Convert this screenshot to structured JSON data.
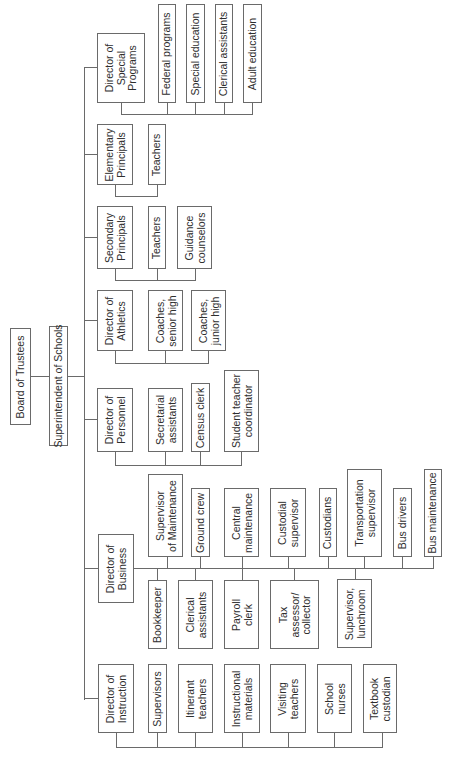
{
  "diagram": {
    "type": "organizational-chart",
    "orientation": "rotated-90-ccw",
    "root": {
      "label": "Board of Trustees",
      "rect": [
        10,
        328,
        21,
        97
      ]
    },
    "superintendent": {
      "label": "Superintendent of Schools",
      "rect": [
        49,
        326,
        19,
        120
      ]
    },
    "directors": [
      {
        "label": "Director of\nSpecial\nPrograms",
        "rect": [
          97,
          33,
          48,
          70
        ],
        "children": [
          {
            "label": "Federal programs",
            "rect": [
              158,
              4,
              18,
              99
            ]
          },
          {
            "label": "Special education",
            "rect": [
              186,
              4,
              19,
              99
            ]
          },
          {
            "label": "Clerical assistants",
            "rect": [
              215,
              4,
              18,
              99
            ]
          },
          {
            "label": "Adult education",
            "rect": [
              243,
              4,
              19,
              99
            ]
          }
        ]
      },
      {
        "label": "Elementary\nPrincipals",
        "rect": [
          97,
          124,
          36,
          61
        ],
        "children": [
          {
            "label": "Teachers",
            "rect": [
              148,
              124,
              18,
              61
            ]
          }
        ]
      },
      {
        "label": "Secondary\nPrincipals",
        "rect": [
          97,
          206,
          36,
          63
        ],
        "children": [
          {
            "label": "Teachers",
            "rect": [
              148,
              206,
              18,
              63
            ]
          },
          {
            "label": "Guidance\ncounselors",
            "rect": [
              177,
              206,
              35,
              63
            ]
          }
        ]
      },
      {
        "label": "Director of\nAthletics",
        "rect": [
          97,
          290,
          36,
          61
        ],
        "children": [
          {
            "label": "Coaches,\nsenior high",
            "rect": [
              148,
              290,
              35,
              61
            ]
          },
          {
            "label": "Coaches,\njunior high",
            "rect": [
              191,
              290,
              35,
              61
            ]
          }
        ]
      },
      {
        "label": "Director of\nPersonnel",
        "rect": [
          97,
          388,
          36,
          64
        ],
        "children": [
          {
            "label": "Secretarial\nassistants",
            "rect": [
              148,
              388,
              35,
              64
            ]
          },
          {
            "label": "Census clerk",
            "rect": [
              191,
              383,
              19,
              69
            ]
          },
          {
            "label": "Student teacher\ncoordinator",
            "rect": [
              224,
              370,
              35,
              82
            ]
          }
        ]
      },
      {
        "label": "Director of\nBusiness",
        "rect": [
          98,
          534,
          36,
          69
        ],
        "children_upper": [
          {
            "label": "Supervisor\nof Maintenance",
            "rect": [
              148,
              474,
              35,
              83
            ]
          },
          {
            "label": "Ground crew",
            "rect": [
              191,
              488,
              19,
              69
            ]
          },
          {
            "label": "Central\nmaintenance",
            "rect": [
              224,
              488,
              35,
              69
            ]
          },
          {
            "label": "Custodial\nsupervisor",
            "rect": [
              270,
              488,
              36,
              69
            ]
          },
          {
            "label": "Custodians",
            "rect": [
              319,
              488,
              18,
              69
            ]
          },
          {
            "label": "Transportation\nsupervisor",
            "rect": [
              347,
              469,
              35,
              88
            ]
          },
          {
            "label": "Bus drivers",
            "rect": [
              393,
              488,
              19,
              69
            ]
          },
          {
            "label": "Bus maintenance",
            "rect": [
              424,
              469,
              18,
              88
            ]
          }
        ],
        "children_lower": [
          {
            "label": "Bookkeeper",
            "rect": [
              148,
              580,
              19,
              69
            ]
          },
          {
            "label": "Clerical\nassistants",
            "rect": [
              178,
              580,
              35,
              69
            ]
          },
          {
            "label": "Payroll\nclerk",
            "rect": [
              224,
              580,
              35,
              69
            ]
          },
          {
            "label": "Tax\nassessor/\ncollector",
            "rect": [
              270,
              580,
              49,
              69
            ]
          },
          {
            "label": "Supervisor,\nlunchroom",
            "rect": [
              337,
              579,
              35,
              69
            ]
          }
        ]
      },
      {
        "label": "Director of\nInstruction",
        "rect": [
          98,
          664,
          36,
          69
        ],
        "children": [
          {
            "label": "Supervisors",
            "rect": [
              148,
              664,
              19,
              69
            ]
          },
          {
            "label": "Itinerant\nteachers",
            "rect": [
              178,
              664,
              35,
              69
            ]
          },
          {
            "label": "Instructional\nmaterials",
            "rect": [
              224,
              664,
              36,
              69
            ]
          },
          {
            "label": "Visiting\nteachers",
            "rect": [
              270,
              664,
              36,
              69
            ]
          },
          {
            "label": "School\nnurses",
            "rect": [
              317,
              664,
              35,
              69
            ]
          },
          {
            "label": "Textbook\ncustodian",
            "rect": [
              363,
              664,
              34,
              69
            ]
          }
        ]
      }
    ],
    "lines": [
      [
        31,
        376,
        49,
        376
      ],
      [
        68,
        376,
        84,
        376
      ],
      [
        84,
        67,
        84,
        699
      ],
      [
        84,
        67,
        97,
        67
      ],
      [
        84,
        154,
        97,
        154
      ],
      [
        84,
        237,
        97,
        237
      ],
      [
        84,
        320,
        97,
        320
      ],
      [
        84,
        419,
        97,
        419
      ],
      [
        84,
        568,
        98,
        568
      ],
      [
        84,
        698,
        98,
        698
      ],
      [
        121,
        103,
        121,
        114
      ],
      [
        121,
        114,
        252,
        114
      ],
      [
        167,
        103,
        167,
        114
      ],
      [
        195,
        103,
        195,
        114
      ],
      [
        224,
        103,
        224,
        114
      ],
      [
        252,
        103,
        252,
        114
      ],
      [
        115,
        185,
        115,
        196
      ],
      [
        115,
        196,
        157,
        196
      ],
      [
        157,
        185,
        157,
        196
      ],
      [
        115,
        269,
        115,
        280
      ],
      [
        115,
        280,
        195,
        280
      ],
      [
        157,
        269,
        157,
        280
      ],
      [
        195,
        269,
        195,
        280
      ],
      [
        115,
        351,
        115,
        363
      ],
      [
        115,
        363,
        208,
        363
      ],
      [
        165,
        351,
        165,
        363
      ],
      [
        208,
        351,
        208,
        363
      ],
      [
        115,
        452,
        115,
        465
      ],
      [
        115,
        465,
        241,
        465
      ],
      [
        165,
        452,
        165,
        465
      ],
      [
        200,
        452,
        200,
        465
      ],
      [
        241,
        452,
        241,
        465
      ],
      [
        134,
        568,
        433,
        568
      ],
      [
        167,
        557,
        167,
        568
      ],
      [
        200,
        557,
        200,
        568
      ],
      [
        242,
        557,
        242,
        568
      ],
      [
        288,
        557,
        288,
        568
      ],
      [
        328,
        557,
        328,
        568
      ],
      [
        364,
        557,
        364,
        568
      ],
      [
        402,
        557,
        402,
        568
      ],
      [
        433,
        557,
        433,
        568
      ],
      [
        157,
        568,
        157,
        580
      ],
      [
        195,
        568,
        195,
        580
      ],
      [
        242,
        568,
        242,
        580
      ],
      [
        294,
        568,
        294,
        580
      ],
      [
        355,
        568,
        355,
        579
      ],
      [
        116,
        733,
        116,
        747
      ],
      [
        116,
        747,
        382,
        747
      ],
      [
        157,
        733,
        157,
        747
      ],
      [
        195,
        733,
        195,
        747
      ],
      [
        242,
        733,
        242,
        747
      ],
      [
        288,
        733,
        288,
        747
      ],
      [
        334,
        733,
        334,
        747
      ],
      [
        382,
        733,
        382,
        747
      ]
    ],
    "colors": {
      "line": "#6a6a6a",
      "text": "#2e2e2e",
      "background": "#ffffff"
    }
  }
}
